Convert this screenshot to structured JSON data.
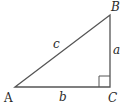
{
  "diagram": {
    "type": "right-triangle",
    "colors": {
      "stroke": "#555555",
      "text": "#2a2a2a",
      "background": "#ffffff"
    },
    "vertices": {
      "A": {
        "label": "A",
        "x": 15,
        "y": 87
      },
      "B": {
        "label": "B",
        "x": 110,
        "y": 15
      },
      "C": {
        "label": "C",
        "x": 110,
        "y": 87
      }
    },
    "sides": {
      "a": {
        "label": "a",
        "from": "B",
        "to": "C"
      },
      "b": {
        "label": "b",
        "from": "A",
        "to": "C"
      },
      "c": {
        "label": "c",
        "from": "A",
        "to": "B"
      }
    },
    "right_angle_at": "C"
  }
}
